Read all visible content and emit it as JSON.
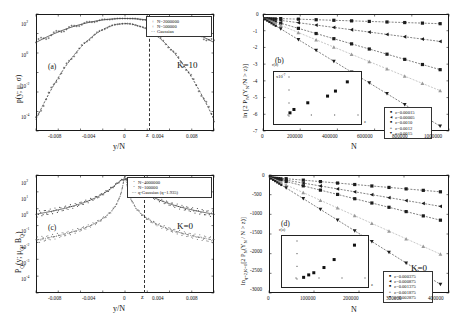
{
  "figure": {
    "width": 462,
    "height": 327,
    "background": "#ffffff",
    "line_color": "#1a1a1a"
  },
  "chart_data": [
    {
      "id": "panel-a",
      "type": "line",
      "panel_label": "(a)",
      "title": "",
      "xlabel": "y/N",
      "ylabel": "p(y; μ, σ)",
      "annotation": "K=10",
      "xticks": [
        -0.008,
        -0.004,
        0,
        0.004,
        0.008
      ],
      "xticklabels": [
        "-0.008",
        "-0.004",
        "0",
        "0.004",
        "0.008"
      ],
      "xlim": [
        -0.0105,
        0.0105
      ],
      "yticklabels": [
        "10²",
        "10⁰",
        "10⁻²",
        "10⁻⁴"
      ],
      "yscale": "log",
      "ylim": [
        -4.6,
        2.7
      ],
      "marker_z": {
        "label": "z",
        "x": 0.0028
      },
      "legend": [
        {
          "symbol": "+",
          "label": "N=2000000",
          "color": "#222222"
        },
        {
          "symbol": "+",
          "label": "N=500000",
          "color": "#555555"
        },
        {
          "symbol": "— —",
          "label": "Gaussian",
          "color": "#333333"
        }
      ],
      "series": [
        {
          "name": "N=2000000",
          "sigma_rel": 0.004,
          "peak_log10": 2.42,
          "comment": "broad gaussian, log10 p = peak - (x/sigma)^2/2/ln10"
        },
        {
          "name": "N=500000",
          "sigma_rel": 0.002,
          "peak_log10": 2.1,
          "comment": "narrow gaussian"
        }
      ]
    },
    {
      "id": "panel-b",
      "type": "scatter",
      "panel_label": "(b)",
      "xlabel": "N",
      "ylabel": "ln [2 Pₙ(Yₙ/N > z)]",
      "annotation": "K=10",
      "xticks": [
        0,
        200000,
        400000,
        600000,
        800000,
        1000000
      ],
      "xticklabels": [
        "0",
        "200000",
        "400000",
        "600000",
        "800000",
        "1000000"
      ],
      "xlim": [
        0,
        1050000
      ],
      "yticks": [
        0,
        -1,
        -2,
        -3,
        -4,
        -5,
        -6,
        -7
      ],
      "yticklabels": [
        "0",
        "-1",
        "-2",
        "-3",
        "-4",
        "-5",
        "-6",
        "-7"
      ],
      "ylim": [
        -7,
        0.25
      ],
      "legend": [
        {
          "symbol": "■",
          "label": "z=0.00015",
          "color": "#111111"
        },
        {
          "symbol": "◄",
          "label": "z=0.00005",
          "color": "#222222"
        },
        {
          "symbol": "■",
          "label": "z=0.0010",
          "color": "#333333"
        },
        {
          "symbol": "▲",
          "label": "z=0.0012",
          "color": "#888888"
        },
        {
          "symbol": "▼",
          "label": "z=0.0015",
          "color": "#444444"
        }
      ],
      "series": [
        {
          "name": "z=0.00015",
          "slope_per_1e6": -0.35,
          "marker": "square"
        },
        {
          "name": "z=0.00005",
          "slope_per_1e6": -1.45,
          "marker": "triangle-left"
        },
        {
          "name": "z=0.0010",
          "slope_per_1e6": -3.2,
          "marker": "square"
        },
        {
          "name": "z=0.0012",
          "slope_per_1e6": -4.5,
          "marker": "triangle-up"
        },
        {
          "name": "z=0.0015",
          "slope_per_1e6": -6.7,
          "marker": "triangle-down"
        }
      ],
      "inset": {
        "ylabel": "r(z)",
        "scale_note": "x10⁻⁷",
        "xlabel": "z",
        "xticklabels": [
          "0",
          "0.0005",
          "0.001",
          "0.0015"
        ],
        "yticklabels": [
          "2",
          "3",
          "4",
          "5",
          "6"
        ],
        "points_x": [
          5e-05,
          0.00015,
          0.0005,
          0.001,
          0.0012,
          0.0015
        ],
        "points_y": [
          2.1,
          2.5,
          3.3,
          4.1,
          4.7,
          5.8
        ]
      }
    },
    {
      "id": "panel-c",
      "type": "line",
      "panel_label": "(c)",
      "xlabel": "y/N",
      "ylabel": "Pᵠ(y; μᵠ, Bᵠ)",
      "annotation": "K=0",
      "xticks": [
        -0.008,
        -0.004,
        0,
        0.004,
        0.008
      ],
      "xticklabels": [
        "-0.008",
        "-0.004",
        "0",
        "0.004",
        "0.008"
      ],
      "xlim": [
        -0.0105,
        0.0105
      ],
      "yticklabels": [
        "10²",
        "10¹",
        "10⁰",
        "10⁻¹",
        "10⁻²",
        "10⁻³",
        "10⁻⁴"
      ],
      "yscale": "log",
      "ylim": [
        -4.5,
        2.6
      ],
      "marker_z": {
        "label": "z",
        "x": 0.0022
      },
      "legend": [
        {
          "symbol": "·",
          "label": "N=4000000",
          "color": "#333333"
        },
        {
          "symbol": "·",
          "label": "N=100000",
          "color": "#666666"
        },
        {
          "symbol": "— · —",
          "label": "q-Gaussian (q=1.935)",
          "color": "#222222"
        }
      ],
      "series": [
        {
          "name": "N=4000000",
          "q": 1.935,
          "beta_rel": 900000,
          "peak_log10": 2.35,
          "comment": "broad heavy-tailed q-gaussian"
        },
        {
          "name": "N=100000",
          "q": 1.935,
          "beta_rel": 40000000,
          "peak_log10": 2.55,
          "comment": "narrow heavy-tailed q-gaussian"
        }
      ]
    },
    {
      "id": "panel-d",
      "type": "scatter",
      "panel_label": "(d)",
      "xlabel": "N",
      "ylabel": "lnₑ₍ₖ₌₀₎[2 Pₙ(Yₙ/N > z)]",
      "annotation": "K=0",
      "xticks": [
        0,
        100000,
        200000,
        300000,
        400000
      ],
      "xticklabels": [
        "0",
        "100000",
        "200000",
        "300000",
        "400000"
      ],
      "xlim": [
        0,
        420000
      ],
      "yticks": [
        0,
        -500,
        -1000,
        -1500,
        -2000,
        -2500,
        -3000
      ],
      "yticklabels": [
        "0",
        "-500",
        "-1000",
        "-1500",
        "-2000",
        "-2500",
        "-3000"
      ],
      "ylim": [
        -3100,
        60
      ],
      "legend": [
        {
          "symbol": "■",
          "label": "z=0.000375",
          "color": "#111111"
        },
        {
          "symbol": "◄",
          "label": "z=0.000875",
          "color": "#222222"
        },
        {
          "symbol": "■",
          "label": "z=0.001375",
          "color": "#333333"
        },
        {
          "symbol": "▲",
          "label": "z=0.001875",
          "color": "#888888"
        },
        {
          "symbol": "▼",
          "label": "z=0.002875",
          "color": "#444444"
        }
      ],
      "series": [
        {
          "name": "z=0.000375",
          "slope_per_400k": -390,
          "marker": "square"
        },
        {
          "name": "z=0.000875",
          "slope_per_400k": -780,
          "marker": "triangle-left"
        },
        {
          "name": "z=0.001375",
          "slope_per_400k": -1150,
          "marker": "square"
        },
        {
          "name": "z=0.001875",
          "slope_per_400k": -2060,
          "marker": "triangle-up"
        },
        {
          "name": "z=0.002875",
          "slope_per_400k": -2870,
          "marker": "triangle-down"
        }
      ],
      "inset": {
        "ylabel": "r(z)",
        "xlabel": "z",
        "xticklabels": [
          "0",
          "0.001",
          "0.002",
          "0.003"
        ],
        "yticklabels": [
          "0.0005",
          "0.001",
          "0.0015"
        ],
        "points_x": [
          0.000375,
          0.000625,
          0.000875,
          0.001375,
          0.001875,
          0.002875
        ],
        "points_y": [
          0.0003,
          0.00038,
          0.00045,
          0.00062,
          0.00088,
          0.00135
        ]
      }
    }
  ]
}
